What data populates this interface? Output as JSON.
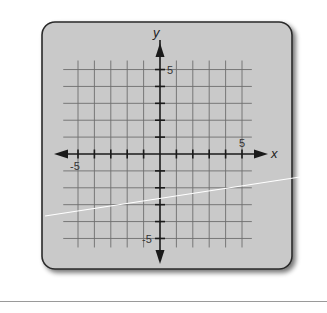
{
  "diagram": {
    "title": "",
    "x_axis_label": "x",
    "y_axis_label": "y",
    "x_tick_labels": {
      "neg": "-5",
      "pos": "5"
    },
    "y_tick_labels": {
      "neg": "-5",
      "pos": "5"
    },
    "x_range": [
      -5,
      5
    ],
    "y_range": [
      -5,
      5
    ],
    "grid_step": 1,
    "colors": {
      "panel": "#c9c9c9",
      "panel_border": "#2a2a2a",
      "grid": "#6e6e6e",
      "axis": "#1a1a1a",
      "overlay_line": "#ffffff",
      "bottom_rule": "#9a9a9a"
    }
  }
}
